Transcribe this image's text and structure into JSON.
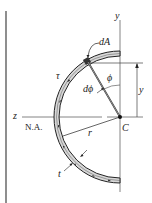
{
  "diagram": {
    "labels": {
      "y_axis": "y",
      "z_axis": "z",
      "neutral_axis": "N.A.",
      "centroid": "C",
      "dA": "dA",
      "phi": "ϕ",
      "dphi": "dϕ",
      "tau": "τ",
      "y_dim": "y",
      "radius": "r",
      "thickness": "t"
    },
    "colors": {
      "line": "#222222",
      "band_fill": "#d8d8d8",
      "background": "#ffffff"
    }
  }
}
